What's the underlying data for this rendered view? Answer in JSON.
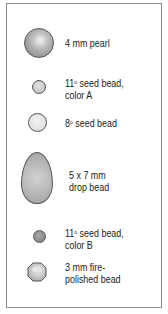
{
  "legend": {
    "items": [
      {
        "id": "pearl",
        "line1": "4 mm pearl",
        "line2": "",
        "shape": "pearl-icon",
        "color": "#9a9a9a"
      },
      {
        "id": "seed-11-a",
        "line1_num": "11",
        "line1_sup": "o",
        "line1_rest": " seed bead,",
        "line2": "color A",
        "shape": "seed-bead-icon",
        "color": "#c8c8c8"
      },
      {
        "id": "seed-8",
        "line1_num": "8",
        "line1_sup": "o",
        "line1_rest": " seed bead",
        "line2": "",
        "shape": "seed-bead-icon",
        "color": "#e2e2e2"
      },
      {
        "id": "drop",
        "line1": "5 x 7 mm",
        "line2": "drop bead",
        "shape": "drop-bead-icon",
        "color": "#b4b4b4"
      },
      {
        "id": "seed-11-b",
        "line1_num": "11",
        "line1_sup": "o",
        "line1_rest": " seed bead,",
        "line2": "color B",
        "shape": "seed-bead-icon",
        "color": "#8c8c8c"
      },
      {
        "id": "fire-polished",
        "line1": "3 mm fire-",
        "line2": "polished bead",
        "shape": "fire-polished-bead-icon",
        "color": "#c4c4c4"
      }
    ]
  }
}
